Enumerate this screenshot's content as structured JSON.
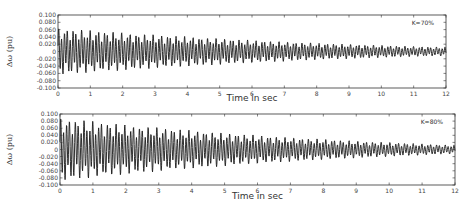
{
  "chart_data": [
    {
      "type": "line",
      "title": "",
      "annotation": "K=70%",
      "xlabel": "Time in sec",
      "ylabel": "Δω (pu)",
      "xlim": [
        0,
        12
      ],
      "ylim": [
        -0.1,
        0.1
      ],
      "xticks": [
        "0",
        "1",
        "2",
        "3",
        "4",
        "5",
        "6",
        "7",
        "8",
        "9",
        "10",
        "11",
        "12"
      ],
      "yticks": [
        "0.100",
        "0.080",
        "0.060",
        "0.040",
        "0.020",
        "0",
        "-0.020",
        "-0.040",
        "-0.060",
        "-0.080",
        "-0.100"
      ],
      "grid": false,
      "series": [
        {
          "name": "Δω",
          "description": "damped oscillation",
          "initial_amplitude": 0.065,
          "final_amplitude": 0.012,
          "x": [
            0,
            1,
            2,
            3,
            4,
            5,
            6,
            7,
            8,
            9,
            10,
            11,
            12
          ],
          "envelope": [
            0.065,
            0.058,
            0.052,
            0.046,
            0.041,
            0.036,
            0.031,
            0.027,
            0.023,
            0.02,
            0.017,
            0.014,
            0.012
          ]
        }
      ]
    },
    {
      "type": "line",
      "title": "",
      "annotation": "K=80%",
      "xlabel": "Time in sec",
      "ylabel": "Δω (pu)",
      "xlim": [
        0,
        12
      ],
      "ylim": [
        -0.1,
        0.1
      ],
      "xticks": [
        "0",
        "1",
        "2",
        "3",
        "4",
        "5",
        "6",
        "7",
        "8",
        "9",
        "10",
        "11",
        "12"
      ],
      "yticks": [
        "0.100",
        "0.080",
        "0.060",
        "0.040",
        "0.020",
        "0",
        "-0.020",
        "-0.040",
        "-0.060",
        "-0.080",
        "-0.100"
      ],
      "grid": false,
      "series": [
        {
          "name": "Δω",
          "description": "damped oscillation",
          "initial_amplitude": 0.09,
          "final_amplitude": 0.012,
          "x": [
            0,
            1,
            2,
            3,
            4,
            5,
            6,
            7,
            8,
            9,
            10,
            11,
            12
          ],
          "envelope": [
            0.09,
            0.08,
            0.07,
            0.062,
            0.054,
            0.047,
            0.04,
            0.034,
            0.029,
            0.024,
            0.02,
            0.016,
            0.012
          ]
        }
      ]
    }
  ]
}
